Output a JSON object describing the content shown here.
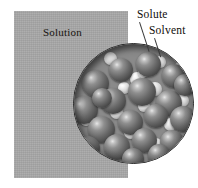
{
  "figure": {
    "type": "illustration",
    "width": 198,
    "height": 188,
    "background_color": "#ffffff"
  },
  "solution_block": {
    "label": "Solution",
    "color": "#a8a8a8",
    "bounds": {
      "x": 14,
      "y": 11,
      "width": 114,
      "height": 167
    }
  },
  "callouts": [
    {
      "key": "solute",
      "label": "Solute",
      "label_position": {
        "x": 137,
        "y": 8
      },
      "leader_line": {
        "x": 140,
        "y": 22,
        "length": 31,
        "angle_deg": 72
      }
    },
    {
      "key": "solvent",
      "label": "Solvent",
      "label_position": {
        "x": 149,
        "y": 24
      },
      "leader_line": {
        "x": 155,
        "y": 38,
        "length": 20,
        "angle_deg": 72
      }
    }
  ],
  "magnifier": {
    "center": {
      "x": 133,
      "y": 103
    },
    "radius": 60,
    "border_color": "#2b2b2b",
    "background_color": "#8a8a8a"
  },
  "particles": {
    "solvent": {
      "name": "solvent-sphere",
      "description": "large dark gray sphere",
      "color_light": "#e8e8e8",
      "color_dark": "#343434",
      "items": [
        {
          "x": 8,
          "y": 26,
          "d": 27
        },
        {
          "x": 35,
          "y": 14,
          "d": 24
        },
        {
          "x": 62,
          "y": 8,
          "d": 25
        },
        {
          "x": 88,
          "y": 20,
          "d": 24
        },
        {
          "x": -4,
          "y": 52,
          "d": 28
        },
        {
          "x": 26,
          "y": 44,
          "d": 26
        },
        {
          "x": 54,
          "y": 34,
          "d": 28
        },
        {
          "x": 82,
          "y": 46,
          "d": 26
        },
        {
          "x": 100,
          "y": 30,
          "d": 22
        },
        {
          "x": 14,
          "y": 72,
          "d": 27
        },
        {
          "x": 44,
          "y": 66,
          "d": 25
        },
        {
          "x": 70,
          "y": 60,
          "d": 24
        },
        {
          "x": 96,
          "y": 62,
          "d": 26
        },
        {
          "x": 2,
          "y": 92,
          "d": 24
        },
        {
          "x": 30,
          "y": 90,
          "d": 26
        },
        {
          "x": 58,
          "y": 84,
          "d": 25
        },
        {
          "x": 86,
          "y": 86,
          "d": 24
        },
        {
          "x": 18,
          "y": 44,
          "d": 20
        },
        {
          "x": 48,
          "y": 104,
          "d": 22
        },
        {
          "x": 74,
          "y": 100,
          "d": 22
        }
      ]
    },
    "solute": {
      "name": "solute-particle",
      "description": "small light wedge-shaped particle",
      "color_light": "#ffffff",
      "color_dark": "#8d8d8d",
      "items": [
        {
          "x": 30,
          "y": 8,
          "d": 13
        },
        {
          "x": 56,
          "y": 28,
          "d": 14
        },
        {
          "x": 80,
          "y": 12,
          "d": 12
        },
        {
          "x": 100,
          "y": 18,
          "d": 12
        },
        {
          "x": 14,
          "y": 40,
          "d": 13
        },
        {
          "x": 44,
          "y": 38,
          "d": 12
        },
        {
          "x": 74,
          "y": 38,
          "d": 14
        },
        {
          "x": 102,
          "y": 50,
          "d": 13
        },
        {
          "x": 6,
          "y": 70,
          "d": 12
        },
        {
          "x": 36,
          "y": 62,
          "d": 13
        },
        {
          "x": 64,
          "y": 56,
          "d": 12
        },
        {
          "x": 90,
          "y": 74,
          "d": 13
        },
        {
          "x": 22,
          "y": 86,
          "d": 12
        },
        {
          "x": 50,
          "y": 82,
          "d": 13
        },
        {
          "x": 76,
          "y": 94,
          "d": 12
        },
        {
          "x": 100,
          "y": 92,
          "d": 12
        },
        {
          "x": 40,
          "y": 100,
          "d": 11
        },
        {
          "x": 64,
          "y": 24,
          "d": 10
        }
      ]
    }
  }
}
